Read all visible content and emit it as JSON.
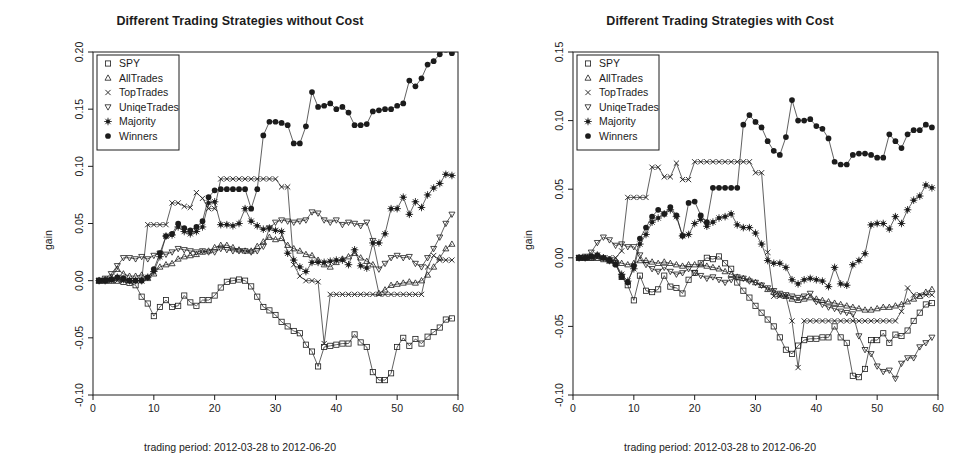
{
  "figure": {
    "width": 960,
    "height": 471,
    "background": "#ffffff",
    "foreground": "#1c1c1c"
  },
  "panels": [
    {
      "id": "left",
      "title": "Different Trading Strategies without Cost",
      "xlabel": "trading period: 2012-03-28 to 2012-06-20",
      "ylabel": "gain"
    },
    {
      "id": "right",
      "title": "Different Trading Strategies with Cost",
      "xlabel": "trading period: 2012-03-28 to 2012-06-20",
      "ylabel": "gain"
    }
  ],
  "legend": {
    "entries": [
      {
        "label": "SPY",
        "symbol": "square"
      },
      {
        "label": "AllTrades",
        "symbol": "triangle-up"
      },
      {
        "label": "TopTrades",
        "symbol": "cross"
      },
      {
        "label": "UniqeTrades",
        "symbol": "triangle-down"
      },
      {
        "label": "Majority",
        "symbol": "asterisk"
      },
      {
        "label": "Winners",
        "symbol": "filled-circle"
      }
    ]
  },
  "chart_data": [
    {
      "id": "without-cost",
      "type": "line",
      "title": "Different Trading Strategies without Cost",
      "xlabel": "trading period: 2012-03-28 to 2012-06-20",
      "ylabel": "gain",
      "xlim": [
        0,
        60
      ],
      "ylim": [
        -0.1,
        0.2
      ],
      "xticks": [
        0,
        10,
        20,
        30,
        40,
        50,
        60
      ],
      "yticks": [
        -0.1,
        -0.05,
        0.0,
        0.05,
        0.1,
        0.15,
        0.2
      ],
      "ytick_labels": [
        "-0.10",
        "-0.05",
        "0.00",
        "0.05",
        "0.10",
        "0.15",
        "0.20"
      ],
      "grid": false,
      "legend_position": "top-left",
      "x": [
        1,
        2,
        3,
        4,
        5,
        6,
        7,
        8,
        9,
        10,
        11,
        12,
        13,
        14,
        15,
        16,
        17,
        18,
        19,
        20,
        21,
        22,
        23,
        24,
        25,
        26,
        27,
        28,
        29,
        30,
        31,
        32,
        33,
        34,
        35,
        36,
        37,
        38,
        39,
        40,
        41,
        42,
        43,
        44,
        45,
        46,
        47,
        48,
        49,
        50,
        51,
        52,
        53,
        54,
        55,
        56,
        57,
        58,
        59
      ],
      "series": [
        {
          "name": "SPY",
          "symbol": "square",
          "values": [
            0.0,
            0.0,
            0.0,
            0.0,
            -0.001,
            -0.002,
            -0.004,
            -0.014,
            -0.02,
            -0.031,
            -0.023,
            -0.017,
            -0.023,
            -0.022,
            -0.013,
            -0.019,
            -0.022,
            -0.017,
            -0.017,
            -0.013,
            -0.006,
            -0.001,
            0.0,
            0.001,
            0.0,
            -0.005,
            -0.014,
            -0.023,
            -0.026,
            -0.03,
            -0.036,
            -0.04,
            -0.044,
            -0.046,
            -0.056,
            -0.062,
            -0.075,
            -0.058,
            -0.057,
            -0.056,
            -0.055,
            -0.055,
            -0.047,
            -0.054,
            -0.058,
            -0.08,
            -0.087,
            -0.087,
            -0.081,
            -0.058,
            -0.05,
            -0.057,
            -0.051,
            -0.055,
            -0.049,
            -0.045,
            -0.041,
            -0.034,
            -0.033
          ]
        },
        {
          "name": "AllTrades",
          "symbol": "triangle-up",
          "values": [
            0.0,
            0.001,
            0.003,
            0.01,
            0.006,
            0.004,
            0.004,
            0.005,
            0.002,
            0.006,
            0.012,
            0.014,
            0.015,
            0.019,
            0.021,
            0.022,
            0.023,
            0.025,
            0.026,
            0.029,
            0.031,
            0.031,
            0.029,
            0.027,
            0.026,
            0.026,
            0.03,
            0.034,
            0.038,
            0.036,
            0.037,
            0.031,
            0.028,
            0.026,
            0.023,
            0.022,
            0.018,
            0.014,
            0.012,
            0.016,
            0.019,
            0.021,
            0.024,
            0.02,
            0.017,
            0.014,
            -0.011,
            -0.008,
            -0.004,
            -0.003,
            -0.002,
            -0.001,
            -0.002,
            0.0,
            0.005,
            0.012,
            0.02,
            0.028,
            0.032
          ]
        },
        {
          "name": "TopTrades",
          "symbol": "cross",
          "values": [
            0.0,
            0.0,
            0.0,
            0.0,
            0.0,
            0.0,
            0.0,
            0.0,
            0.049,
            0.049,
            0.049,
            0.049,
            0.068,
            0.068,
            0.065,
            0.064,
            0.077,
            0.072,
            0.063,
            0.063,
            0.089,
            0.089,
            0.089,
            0.089,
            0.089,
            0.089,
            0.089,
            0.089,
            0.089,
            0.089,
            0.082,
            0.082,
            0.014,
            0.004,
            0.0,
            0.0,
            -0.001,
            -0.055,
            -0.012,
            -0.012,
            -0.012,
            -0.012,
            -0.012,
            -0.012,
            -0.012,
            -0.012,
            -0.012,
            -0.012,
            -0.012,
            -0.012,
            -0.012,
            -0.012,
            -0.012,
            -0.012,
            0.012,
            0.022,
            0.018,
            0.018,
            0.018
          ]
        },
        {
          "name": "UniqeTrades",
          "symbol": "triangle-down",
          "values": [
            0.0,
            0.002,
            0.006,
            0.013,
            0.02,
            0.02,
            0.019,
            0.021,
            0.019,
            0.022,
            0.024,
            0.023,
            0.025,
            0.028,
            0.027,
            0.026,
            0.025,
            0.026,
            0.025,
            0.025,
            0.028,
            0.027,
            0.026,
            0.026,
            0.026,
            0.025,
            0.026,
            0.03,
            0.046,
            0.051,
            0.053,
            0.052,
            0.051,
            0.052,
            0.053,
            0.06,
            0.059,
            0.053,
            0.051,
            0.053,
            0.049,
            0.051,
            0.05,
            0.048,
            0.051,
            0.035,
            0.01,
            0.015,
            0.02,
            0.022,
            0.02,
            0.021,
            0.015,
            0.012,
            0.02,
            0.028,
            0.038,
            0.05,
            0.058
          ]
        },
        {
          "name": "Majority",
          "symbol": "asterisk",
          "values": [
            0.0,
            0.0,
            0.001,
            0.003,
            0.001,
            0.0,
            0.0,
            0.0,
            0.003,
            0.008,
            0.021,
            0.039,
            0.04,
            0.047,
            0.043,
            0.041,
            0.043,
            0.047,
            0.068,
            0.069,
            0.049,
            0.049,
            0.048,
            0.05,
            0.063,
            0.052,
            0.048,
            0.045,
            0.046,
            0.044,
            0.043,
            0.024,
            0.018,
            0.012,
            0.008,
            0.016,
            0.016,
            0.016,
            0.017,
            0.018,
            0.018,
            0.014,
            0.027,
            0.013,
            0.011,
            0.033,
            0.033,
            0.041,
            0.063,
            0.063,
            0.073,
            0.058,
            0.069,
            0.064,
            0.075,
            0.081,
            0.085,
            0.093,
            0.092
          ]
        },
        {
          "name": "Winners",
          "symbol": "filled-circle",
          "values": [
            0.0,
            0.0,
            0.001,
            0.003,
            0.002,
            0.0,
            0.0,
            0.0,
            0.003,
            0.01,
            0.024,
            0.039,
            0.041,
            0.05,
            0.046,
            0.044,
            0.047,
            0.052,
            0.073,
            0.079,
            0.08,
            0.08,
            0.08,
            0.08,
            0.08,
            0.063,
            0.08,
            0.127,
            0.139,
            0.139,
            0.138,
            0.136,
            0.12,
            0.12,
            0.135,
            0.165,
            0.152,
            0.153,
            0.155,
            0.15,
            0.152,
            0.147,
            0.136,
            0.136,
            0.137,
            0.148,
            0.149,
            0.15,
            0.15,
            0.153,
            0.155,
            0.175,
            0.17,
            0.177,
            0.189,
            0.192,
            0.198,
            0.202,
            0.199
          ]
        }
      ]
    },
    {
      "id": "with-cost",
      "type": "line",
      "title": "Different Trading Strategies with Cost",
      "xlabel": "trading period: 2012-03-28 to 2012-06-20",
      "ylabel": "gain",
      "xlim": [
        0,
        60
      ],
      "ylim": [
        -0.1,
        0.15
      ],
      "xticks": [
        0,
        10,
        20,
        30,
        40,
        50,
        60
      ],
      "yticks": [
        -0.1,
        -0.05,
        0.0,
        0.05,
        0.1,
        0.15
      ],
      "ytick_labels": [
        "-0.10",
        "-0.05",
        "0.00",
        "0.05",
        "0.10",
        "0.15"
      ],
      "grid": false,
      "legend_position": "top-left",
      "x": [
        1,
        2,
        3,
        4,
        5,
        6,
        7,
        8,
        9,
        10,
        11,
        12,
        13,
        14,
        15,
        16,
        17,
        18,
        19,
        20,
        21,
        22,
        23,
        24,
        25,
        26,
        27,
        28,
        29,
        30,
        31,
        32,
        33,
        34,
        35,
        36,
        37,
        38,
        39,
        40,
        41,
        42,
        43,
        44,
        45,
        46,
        47,
        48,
        49,
        50,
        51,
        52,
        53,
        54,
        55,
        56,
        57,
        58,
        59
      ],
      "series": [
        {
          "name": "SPY",
          "symbol": "square",
          "values": [
            0.0,
            0.0,
            0.0,
            0.0,
            -0.001,
            -0.002,
            -0.004,
            -0.014,
            -0.02,
            -0.031,
            -0.013,
            -0.024,
            -0.025,
            -0.023,
            -0.013,
            -0.021,
            -0.022,
            -0.026,
            -0.016,
            -0.011,
            -0.004,
            0.0,
            -0.001,
            0.001,
            -0.004,
            -0.008,
            -0.018,
            -0.024,
            -0.029,
            -0.035,
            -0.04,
            -0.045,
            -0.05,
            -0.058,
            -0.067,
            -0.07,
            -0.064,
            -0.06,
            -0.059,
            -0.059,
            -0.058,
            -0.058,
            -0.05,
            -0.058,
            -0.062,
            -0.086,
            -0.087,
            -0.081,
            -0.06,
            -0.06,
            -0.055,
            -0.062,
            -0.056,
            -0.057,
            -0.053,
            -0.046,
            -0.04,
            -0.034,
            -0.033
          ]
        },
        {
          "name": "AllTrades",
          "symbol": "triangle-up",
          "values": [
            0.0,
            0.0,
            0.0,
            0.001,
            0.0,
            -0.001,
            -0.002,
            -0.004,
            -0.005,
            -0.004,
            -0.002,
            -0.002,
            -0.003,
            -0.004,
            -0.003,
            -0.004,
            -0.005,
            -0.006,
            -0.005,
            -0.005,
            -0.005,
            -0.006,
            -0.007,
            -0.008,
            -0.01,
            -0.012,
            -0.014,
            -0.015,
            -0.016,
            -0.018,
            -0.02,
            -0.023,
            -0.025,
            -0.027,
            -0.028,
            -0.03,
            -0.031,
            -0.03,
            -0.029,
            -0.03,
            -0.031,
            -0.032,
            -0.033,
            -0.034,
            -0.035,
            -0.036,
            -0.037,
            -0.038,
            -0.038,
            -0.037,
            -0.036,
            -0.036,
            -0.035,
            -0.034,
            -0.032,
            -0.03,
            -0.028,
            -0.025,
            -0.023
          ]
        },
        {
          "name": "TopTrades",
          "symbol": "cross",
          "values": [
            0.0,
            0.0,
            0.0,
            0.0,
            0.0,
            0.0,
            0.0,
            0.005,
            0.044,
            0.044,
            0.044,
            0.044,
            0.066,
            0.066,
            0.059,
            0.059,
            0.069,
            0.057,
            0.057,
            0.07,
            0.07,
            0.07,
            0.07,
            0.07,
            0.07,
            0.07,
            0.07,
            0.07,
            0.07,
            0.062,
            0.062,
            0.004,
            -0.028,
            -0.028,
            -0.028,
            -0.046,
            -0.08,
            -0.046,
            -0.046,
            -0.046,
            -0.046,
            -0.046,
            -0.046,
            -0.046,
            -0.046,
            -0.046,
            -0.046,
            -0.046,
            -0.046,
            -0.046,
            -0.046,
            -0.046,
            -0.046,
            -0.039,
            -0.022,
            -0.027,
            -0.027,
            -0.027,
            -0.027
          ]
        },
        {
          "name": "UniqeTrades",
          "symbol": "triangle-down",
          "values": [
            0.0,
            0.001,
            0.004,
            0.011,
            0.015,
            0.013,
            0.009,
            0.01,
            0.008,
            0.008,
            0.002,
            -0.005,
            -0.008,
            -0.01,
            -0.007,
            -0.01,
            -0.012,
            -0.011,
            -0.008,
            -0.011,
            -0.013,
            -0.015,
            -0.014,
            -0.016,
            -0.018,
            -0.016,
            -0.014,
            -0.015,
            -0.017,
            -0.018,
            -0.02,
            -0.022,
            -0.024,
            -0.026,
            -0.027,
            -0.028,
            -0.029,
            -0.028,
            -0.026,
            -0.032,
            -0.034,
            -0.036,
            -0.037,
            -0.039,
            -0.04,
            -0.041,
            -0.057,
            -0.067,
            -0.07,
            -0.079,
            -0.083,
            -0.082,
            -0.088,
            -0.077,
            -0.073,
            -0.073,
            -0.065,
            -0.062,
            -0.058
          ]
        },
        {
          "name": "Majority",
          "symbol": "asterisk",
          "values": [
            0.0,
            0.0,
            0.001,
            0.002,
            0.0,
            -0.002,
            -0.004,
            -0.012,
            -0.017,
            -0.008,
            0.01,
            0.017,
            0.026,
            0.029,
            0.032,
            0.035,
            0.03,
            0.016,
            0.017,
            0.025,
            0.028,
            0.023,
            0.026,
            0.029,
            0.03,
            0.032,
            0.024,
            0.022,
            0.022,
            0.018,
            0.01,
            -0.002,
            -0.004,
            -0.004,
            -0.007,
            -0.016,
            -0.019,
            -0.016,
            -0.015,
            -0.016,
            -0.017,
            -0.021,
            -0.007,
            -0.019,
            -0.02,
            -0.005,
            -0.002,
            0.003,
            0.024,
            0.025,
            0.025,
            0.021,
            0.03,
            0.025,
            0.035,
            0.042,
            0.045,
            0.053,
            0.051
          ]
        },
        {
          "name": "Winners",
          "symbol": "filled-circle",
          "values": [
            0.0,
            0.0,
            0.001,
            0.002,
            0.0,
            -0.002,
            -0.005,
            -0.014,
            -0.018,
            -0.006,
            0.014,
            0.022,
            0.03,
            0.035,
            0.032,
            0.037,
            0.031,
            0.016,
            0.04,
            0.041,
            0.031,
            0.026,
            0.051,
            0.051,
            0.051,
            0.051,
            0.051,
            0.097,
            0.104,
            0.099,
            0.095,
            0.085,
            0.078,
            0.075,
            0.088,
            0.115,
            0.1,
            0.1,
            0.101,
            0.096,
            0.094,
            0.087,
            0.07,
            0.068,
            0.068,
            0.075,
            0.076,
            0.076,
            0.075,
            0.073,
            0.073,
            0.09,
            0.085,
            0.08,
            0.09,
            0.093,
            0.093,
            0.097,
            0.095
          ]
        }
      ]
    }
  ]
}
